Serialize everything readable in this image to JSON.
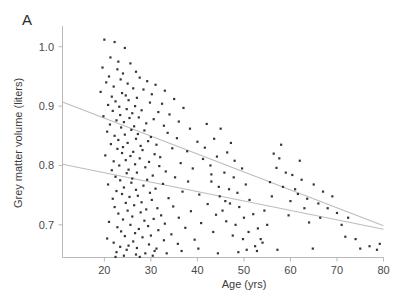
{
  "figure": {
    "panel_label": "A",
    "background": "#ffffff",
    "point_color": "#35353a",
    "line_color": "#bdbdbd",
    "axis_color": "#b9b9b9"
  },
  "chart_data": {
    "type": "scatter",
    "title": "",
    "panel": "A",
    "xlabel": "Age (yrs)",
    "ylabel": "Grey matter volume (liters)",
    "xlim": [
      11,
      80
    ],
    "ylim": [
      0.645,
      1.035
    ],
    "xticks": [
      20,
      30,
      40,
      50,
      60,
      70,
      80
    ],
    "xticklabels": [
      "20",
      "30",
      "40",
      "50",
      "60",
      "70",
      "80"
    ],
    "yticks": [
      0.7,
      0.8,
      0.9,
      1.0
    ],
    "yticklabels": [
      "0.7",
      "0.8",
      "0.9",
      "1.0"
    ],
    "grid": false,
    "legend": null,
    "marker": "square",
    "marker_size_px": 2.2,
    "series": [
      {
        "name": "subjects",
        "points": [
          [
            20.0,
            1.012
          ],
          [
            22.2,
            1.008
          ],
          [
            24.4,
            0.998
          ],
          [
            21.3,
            0.982
          ],
          [
            23.0,
            0.975
          ],
          [
            25.6,
            0.972
          ],
          [
            19.6,
            0.965
          ],
          [
            22.8,
            0.962
          ],
          [
            26.8,
            0.958
          ],
          [
            24.0,
            0.955
          ],
          [
            21.0,
            0.95
          ],
          [
            27.6,
            0.948
          ],
          [
            23.5,
            0.945
          ],
          [
            29.2,
            0.942
          ],
          [
            20.4,
            0.94
          ],
          [
            25.0,
            0.938
          ],
          [
            31.0,
            0.936
          ],
          [
            22.0,
            0.933
          ],
          [
            26.2,
            0.93
          ],
          [
            28.4,
            0.928
          ],
          [
            33.0,
            0.926
          ],
          [
            19.2,
            0.924
          ],
          [
            23.8,
            0.922
          ],
          [
            30.2,
            0.92
          ],
          [
            24.6,
            0.918
          ],
          [
            21.6,
            0.916
          ],
          [
            27.0,
            0.914
          ],
          [
            35.0,
            0.912
          ],
          [
            25.2,
            0.91
          ],
          [
            22.4,
            0.908
          ],
          [
            29.8,
            0.906
          ],
          [
            32.4,
            0.904
          ],
          [
            20.8,
            0.902
          ],
          [
            26.6,
            0.9
          ],
          [
            23.2,
            0.899
          ],
          [
            37.0,
            0.897
          ],
          [
            24.8,
            0.895
          ],
          [
            28.0,
            0.893
          ],
          [
            21.8,
            0.892
          ],
          [
            31.6,
            0.89
          ],
          [
            26.0,
            0.888
          ],
          [
            34.0,
            0.886
          ],
          [
            23.4,
            0.885
          ],
          [
            19.8,
            0.883
          ],
          [
            27.4,
            0.881
          ],
          [
            25.4,
            0.88
          ],
          [
            30.6,
            0.878
          ],
          [
            22.6,
            0.876
          ],
          [
            36.0,
            0.874
          ],
          [
            24.2,
            0.873
          ],
          [
            29.0,
            0.871
          ],
          [
            21.2,
            0.869
          ],
          [
            32.8,
            0.867
          ],
          [
            26.4,
            0.866
          ],
          [
            23.6,
            0.864
          ],
          [
            38.4,
            0.862
          ],
          [
            25.8,
            0.86
          ],
          [
            28.6,
            0.859
          ],
          [
            20.6,
            0.857
          ],
          [
            33.6,
            0.855
          ],
          [
            27.2,
            0.853
          ],
          [
            24.4,
            0.852
          ],
          [
            22.2,
            0.85
          ],
          [
            30.0,
            0.848
          ],
          [
            35.6,
            0.846
          ],
          [
            26.8,
            0.845
          ],
          [
            23.0,
            0.843
          ],
          [
            29.4,
            0.841
          ],
          [
            40.0,
            0.84
          ],
          [
            25.0,
            0.838
          ],
          [
            21.4,
            0.836
          ],
          [
            31.2,
            0.835
          ],
          [
            27.8,
            0.833
          ],
          [
            24.0,
            0.831
          ],
          [
            34.6,
            0.829
          ],
          [
            22.8,
            0.828
          ],
          [
            28.2,
            0.826
          ],
          [
            37.8,
            0.824
          ],
          [
            26.2,
            0.823
          ],
          [
            23.8,
            0.821
          ],
          [
            30.8,
            0.819
          ],
          [
            20.2,
            0.817
          ],
          [
            25.6,
            0.816
          ],
          [
            32.0,
            0.814
          ],
          [
            27.6,
            0.812
          ],
          [
            41.2,
            0.811
          ],
          [
            24.6,
            0.809
          ],
          [
            22.0,
            0.807
          ],
          [
            29.6,
            0.806
          ],
          [
            36.4,
            0.804
          ],
          [
            26.6,
            0.802
          ],
          [
            23.2,
            0.8
          ],
          [
            31.8,
            0.799
          ],
          [
            28.8,
            0.797
          ],
          [
            39.0,
            0.795
          ],
          [
            25.2,
            0.793
          ],
          [
            21.6,
            0.792
          ],
          [
            33.2,
            0.79
          ],
          [
            27.0,
            0.788
          ],
          [
            24.8,
            0.787
          ],
          [
            43.0,
            0.785
          ],
          [
            30.4,
            0.783
          ],
          [
            22.4,
            0.781
          ],
          [
            35.2,
            0.78
          ],
          [
            26.0,
            0.778
          ],
          [
            29.2,
            0.776
          ],
          [
            23.4,
            0.775
          ],
          [
            38.0,
            0.773
          ],
          [
            25.8,
            0.771
          ],
          [
            32.6,
            0.769
          ],
          [
            20.8,
            0.768
          ],
          [
            28.4,
            0.766
          ],
          [
            44.6,
            0.764
          ],
          [
            24.2,
            0.763
          ],
          [
            31.0,
            0.761
          ],
          [
            26.8,
            0.759
          ],
          [
            22.6,
            0.757
          ],
          [
            36.8,
            0.756
          ],
          [
            29.8,
            0.754
          ],
          [
            23.8,
            0.752
          ],
          [
            40.4,
            0.751
          ],
          [
            27.2,
            0.749
          ],
          [
            25.4,
            0.747
          ],
          [
            33.8,
            0.745
          ],
          [
            21.8,
            0.744
          ],
          [
            30.2,
            0.742
          ],
          [
            46.0,
            0.74
          ],
          [
            28.0,
            0.738
          ],
          [
            24.6,
            0.737
          ],
          [
            42.2,
            0.735
          ],
          [
            26.4,
            0.733
          ],
          [
            34.8,
            0.731
          ],
          [
            22.2,
            0.73
          ],
          [
            31.4,
            0.728
          ],
          [
            29.0,
            0.726
          ],
          [
            25.0,
            0.724
          ],
          [
            38.6,
            0.723
          ],
          [
            27.8,
            0.721
          ],
          [
            23.0,
            0.719
          ],
          [
            44.0,
            0.717
          ],
          [
            32.2,
            0.716
          ],
          [
            26.0,
            0.714
          ],
          [
            36.0,
            0.712
          ],
          [
            30.6,
            0.71
          ],
          [
            24.0,
            0.709
          ],
          [
            28.6,
            0.707
          ],
          [
            21.0,
            0.705
          ],
          [
            40.8,
            0.703
          ],
          [
            33.0,
            0.702
          ],
          [
            25.6,
            0.7
          ],
          [
            29.4,
            0.698
          ],
          [
            22.8,
            0.696
          ],
          [
            37.4,
            0.695
          ],
          [
            27.4,
            0.693
          ],
          [
            31.6,
            0.691
          ],
          [
            23.6,
            0.689
          ],
          [
            43.4,
            0.688
          ],
          [
            26.6,
            0.686
          ],
          [
            34.4,
            0.684
          ],
          [
            30.0,
            0.682
          ],
          [
            24.4,
            0.681
          ],
          [
            28.2,
            0.679
          ],
          [
            20.6,
            0.677
          ],
          [
            39.4,
            0.675
          ],
          [
            32.8,
            0.674
          ],
          [
            26.2,
            0.672
          ],
          [
            22.0,
            0.67
          ],
          [
            35.8,
            0.668
          ],
          [
            29.6,
            0.667
          ],
          [
            25.2,
            0.665
          ],
          [
            23.4,
            0.663
          ],
          [
            27.0,
            0.661
          ],
          [
            31.2,
            0.66
          ],
          [
            24.8,
            0.658
          ],
          [
            30.8,
            0.656
          ],
          [
            22.6,
            0.654
          ],
          [
            28.8,
            0.652
          ],
          [
            26.8,
            0.65
          ],
          [
            42.0,
            0.87
          ],
          [
            45.0,
            0.862
          ],
          [
            43.6,
            0.845
          ],
          [
            47.2,
            0.838
          ],
          [
            41.6,
            0.83
          ],
          [
            46.4,
            0.822
          ],
          [
            44.2,
            0.815
          ],
          [
            48.0,
            0.808
          ],
          [
            42.8,
            0.8
          ],
          [
            49.6,
            0.795
          ],
          [
            45.8,
            0.788
          ],
          [
            47.8,
            0.78
          ],
          [
            43.0,
            0.773
          ],
          [
            50.4,
            0.768
          ],
          [
            46.8,
            0.76
          ],
          [
            48.6,
            0.754
          ],
          [
            44.8,
            0.748
          ],
          [
            51.2,
            0.742
          ],
          [
            47.0,
            0.736
          ],
          [
            49.0,
            0.73
          ],
          [
            45.4,
            0.724
          ],
          [
            52.0,
            0.718
          ],
          [
            50.0,
            0.712
          ],
          [
            46.2,
            0.706
          ],
          [
            48.2,
            0.7
          ],
          [
            53.0,
            0.694
          ],
          [
            51.0,
            0.688
          ],
          [
            47.6,
            0.682
          ],
          [
            49.8,
            0.676
          ],
          [
            54.0,
            0.67
          ],
          [
            52.4,
            0.664
          ],
          [
            50.6,
            0.658
          ],
          [
            53.6,
            0.676
          ],
          [
            55.0,
            0.7
          ],
          [
            54.4,
            0.724
          ],
          [
            56.0,
            0.748
          ],
          [
            55.6,
            0.772
          ],
          [
            57.0,
            0.796
          ],
          [
            56.4,
            0.82
          ],
          [
            58.0,
            0.835
          ],
          [
            57.6,
            0.812
          ],
          [
            59.0,
            0.788
          ],
          [
            58.4,
            0.764
          ],
          [
            60.0,
            0.74
          ],
          [
            59.6,
            0.716
          ],
          [
            61.0,
            0.76
          ],
          [
            60.4,
            0.784
          ],
          [
            62.0,
            0.808
          ],
          [
            61.6,
            0.752
          ],
          [
            63.0,
            0.728
          ],
          [
            62.4,
            0.776
          ],
          [
            64.0,
            0.704
          ],
          [
            63.6,
            0.744
          ],
          [
            65.0,
            0.768
          ],
          [
            66.0,
            0.736
          ],
          [
            67.0,
            0.756
          ],
          [
            66.4,
            0.712
          ],
          [
            68.0,
            0.728
          ],
          [
            69.0,
            0.748
          ],
          [
            70.0,
            0.72
          ],
          [
            71.0,
            0.7
          ],
          [
            72.4,
            0.712
          ],
          [
            75.0,
            0.66
          ],
          [
            78.6,
            0.658
          ],
          [
            79.2,
            0.668
          ],
          [
            64.8,
            0.66
          ],
          [
            57.2,
            0.658
          ],
          [
            52.8,
            0.656
          ],
          [
            48.8,
            0.654
          ],
          [
            44.4,
            0.652
          ],
          [
            40.2,
            0.66
          ],
          [
            36.6,
            0.656
          ],
          [
            33.4,
            0.652
          ],
          [
            30.4,
            0.648
          ],
          [
            27.6,
            0.646
          ],
          [
            24.2,
            0.648
          ],
          [
            22.4,
            0.646
          ],
          [
            71.8,
            0.68
          ],
          [
            74.0,
            0.676
          ],
          [
            77.0,
            0.664
          ]
        ]
      }
    ],
    "fit_lines": [
      {
        "name": "upper-fit",
        "x": [
          11,
          80
        ],
        "y": [
          0.907,
          0.6985
        ]
      },
      {
        "name": "lower-fit",
        "x": [
          11,
          80
        ],
        "y": [
          0.802,
          0.6925
        ]
      }
    ]
  }
}
